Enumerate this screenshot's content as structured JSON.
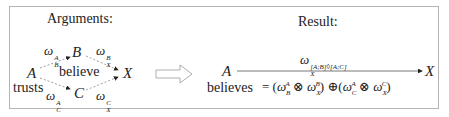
{
  "left_panel": {
    "title": "Arguments:",
    "nodes": {
      "A": "A",
      "B": "B",
      "C": "C",
      "X": "X"
    },
    "labels": {
      "trusts": "trusts",
      "believe": "believe"
    },
    "edges": {
      "AB": {
        "base": "ω",
        "sup": "A",
        "sub": "B"
      },
      "BX": {
        "base": "ω",
        "sup": "B",
        "sub": "X"
      },
      "AC": {
        "base": "ω",
        "sup": "A",
        "sub": "C"
      },
      "CX": {
        "base": "ω",
        "sup": "C",
        "sub": "X"
      }
    }
  },
  "arrow": "implies-arrow",
  "right_panel": {
    "title": "Result:",
    "source": "A",
    "target": "X",
    "source_label": "believes",
    "edge": {
      "base": "ω",
      "sup": "[A;B]◊[A;C]",
      "sub": "X"
    },
    "formula": "= (ω_B^A ⊗ ω_X^B) ⊕ (ω_C^A ⊗ ω_X^C)"
  }
}
